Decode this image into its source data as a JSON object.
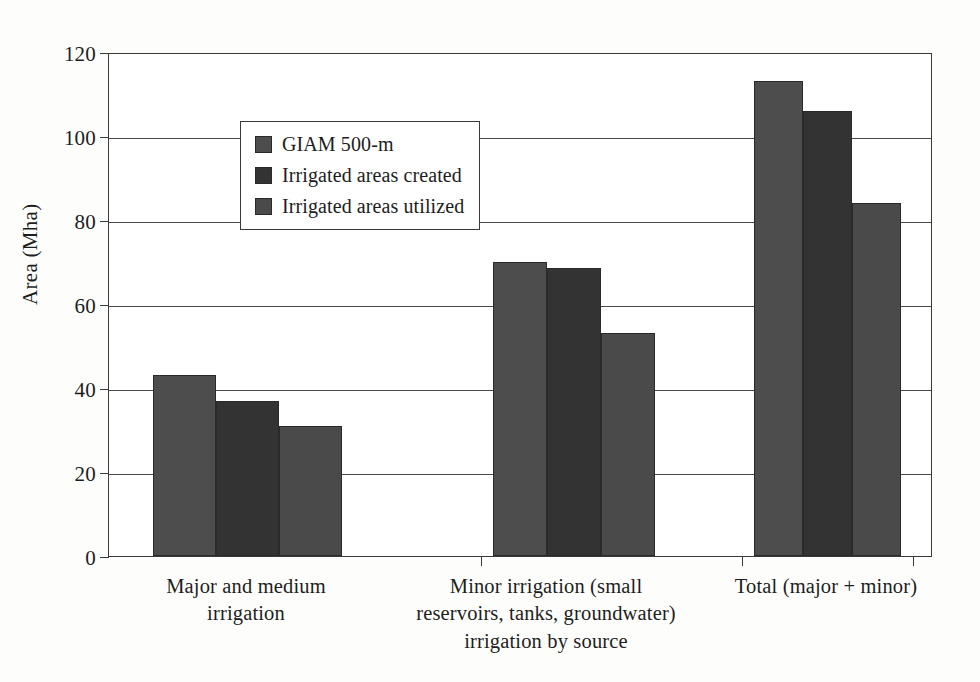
{
  "chart_data": {
    "type": "bar",
    "title": "",
    "xlabel": "",
    "ylabel": "Area (Mha)",
    "ylim": [
      0,
      120
    ],
    "yticks": [
      0,
      20,
      40,
      60,
      80,
      100,
      120
    ],
    "ytick_labels": [
      "0",
      "20",
      "40",
      "60",
      "80",
      "100",
      "120"
    ],
    "grid": true,
    "legend_position": "upper left inside plot",
    "categories": [
      "Major and medium\nirrigation",
      "Minor irrigation (small\nreservoirs, tanks, groundwater)\nirrigation by source",
      "Total (major + minor)"
    ],
    "series": [
      {
        "name": "GIAM 500-m",
        "color": "#4d4d4d",
        "values": [
          43,
          70,
          113
        ]
      },
      {
        "name": "Irrigated areas created",
        "color": "#333333",
        "values": [
          37,
          68.5,
          106
        ]
      },
      {
        "name": "Irrigated areas utilized",
        "color": "#4a4a4a",
        "values": [
          31,
          53,
          84
        ]
      }
    ]
  },
  "axis": {
    "y_title": "Area (Mha)",
    "ticks": [
      {
        "label": "120",
        "value": 120
      },
      {
        "label": "100",
        "value": 100
      },
      {
        "label": "80",
        "value": 80
      },
      {
        "label": "60",
        "value": 60
      },
      {
        "label": "40",
        "value": 40
      },
      {
        "label": "20",
        "value": 20
      },
      {
        "label": "0",
        "value": 0
      }
    ]
  },
  "categories": [
    {
      "line1": "Major and medium",
      "line2": "irrigation",
      "line3": ""
    },
    {
      "line1": "Minor irrigation (small",
      "line2": "reservoirs, tanks, groundwater)",
      "line3": "irrigation by source"
    },
    {
      "line1": "Total (major + minor)",
      "line2": "",
      "line3": ""
    }
  ],
  "legend": {
    "items": [
      {
        "label": "GIAM 500-m",
        "color": "#4d4d4d"
      },
      {
        "label": "Irrigated areas created",
        "color": "#333333"
      },
      {
        "label": "Irrigated areas utilized",
        "color": "#4a4a4a"
      }
    ]
  }
}
